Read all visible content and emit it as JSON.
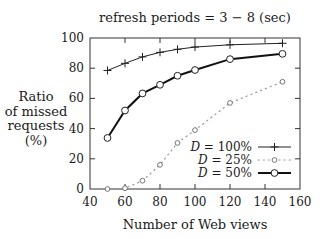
{
  "chart_data": {
    "type": "line",
    "title": "refresh periods = 3 − 8 (sec)",
    "xlabel": "Number of Web views",
    "ylabel": [
      "Ratio",
      "of missed",
      "requests",
      "(%)"
    ],
    "xlim": [
      40,
      160
    ],
    "ylim": [
      0,
      100
    ],
    "xticks": [
      40,
      60,
      80,
      100,
      120,
      140,
      160
    ],
    "yticks": [
      0,
      20,
      40,
      60,
      80,
      100
    ],
    "grid": false,
    "legend_position": "bottom-right",
    "series": [
      {
        "name": "D = 100%",
        "legend_var": "D",
        "legend_rest": " = 100%",
        "style": "thin-solid",
        "marker": "plus",
        "x": [
          50,
          60,
          70,
          80,
          90,
          100,
          120,
          150
        ],
        "values": [
          78.5,
          83.2,
          87.5,
          90.5,
          92.5,
          94,
          95.5,
          96.5
        ]
      },
      {
        "name": "D = 25%",
        "legend_var": "D",
        "legend_rest": " = 25%",
        "style": "dotted",
        "marker": "small-circle",
        "x": [
          50,
          60,
          70,
          80,
          90,
          100,
          120,
          150
        ],
        "values": [
          0,
          0.5,
          5.5,
          16,
          30.5,
          39,
          57,
          71
        ]
      },
      {
        "name": "D = 50%",
        "legend_var": "D",
        "legend_rest": " = 50%",
        "style": "thick-solid",
        "marker": "circle",
        "x": [
          50,
          60,
          70,
          80,
          90,
          100,
          120,
          150
        ],
        "values": [
          33.8,
          52,
          63.3,
          69,
          75,
          78.8,
          86,
          89.5
        ]
      }
    ]
  }
}
